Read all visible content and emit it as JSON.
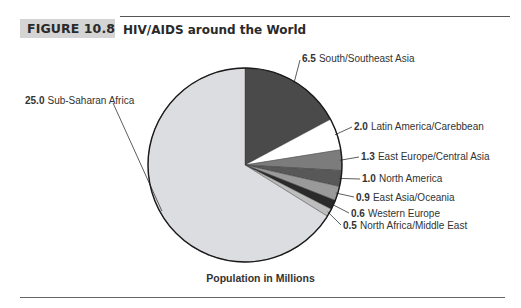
{
  "figure": {
    "label": "FIGURE 10.8",
    "title": "HIV/AIDS around the World",
    "caption": "Population in Millions"
  },
  "chart_data": {
    "type": "pie",
    "title": "HIV/AIDS around the World",
    "subtitle": "Population in Millions",
    "unit": "millions",
    "slices": [
      {
        "label": "South/Southeast Asia",
        "value": 6.5,
        "value_text": "6.5",
        "color": "#4a4a4a"
      },
      {
        "label": "Latin America/Carebbean",
        "value": 2.0,
        "value_text": "2.0",
        "color": "#ffffff"
      },
      {
        "label": "East Europe/Central Asia",
        "value": 1.3,
        "value_text": "1.3",
        "color": "#7c7c7c"
      },
      {
        "label": "North America",
        "value": 1.0,
        "value_text": "1.0",
        "color": "#585858"
      },
      {
        "label": "East Asia/Oceania",
        "value": 0.9,
        "value_text": "0.9",
        "color": "#9a9a9a"
      },
      {
        "label": "Western Europe",
        "value": 0.6,
        "value_text": "0.6",
        "color": "#2a2a2a"
      },
      {
        "label": "North Africa/Middle East",
        "value": 0.5,
        "value_text": "0.5",
        "color": "#bdbdbd"
      },
      {
        "label": "Sub-Saharan Africa",
        "value": 25.0,
        "value_text": "25.0",
        "color": "#dcdde0"
      }
    ],
    "start_angle_deg": 0,
    "direction": "clockwise",
    "legend": "inline-labels"
  }
}
